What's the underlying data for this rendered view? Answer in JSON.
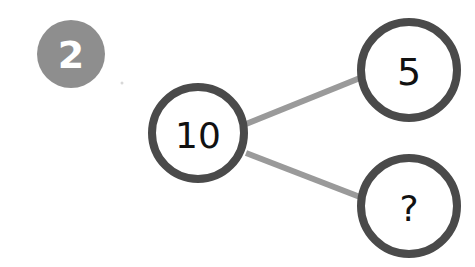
{
  "problem": {
    "number": "2",
    "badge_color": "#8e8e8e"
  },
  "diagram": {
    "type": "number-bond",
    "whole": {
      "label": "10"
    },
    "parts": [
      {
        "label": "5"
      },
      {
        "label": "?"
      }
    ],
    "colors": {
      "circle_stroke": "#4a4a4a",
      "connector": "#9a9a9a",
      "text": "#111111"
    }
  }
}
